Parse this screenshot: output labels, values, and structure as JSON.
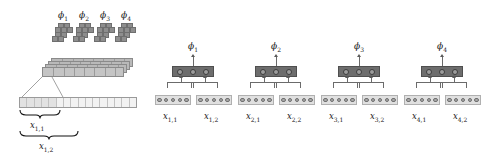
{
  "figure": {
    "title": "",
    "colors": {
      "filter_fill": "#8e8e8e",
      "featuremap_fill": "#b9b9b9",
      "input_tape_fill": "#f2f2f2",
      "input_tape_highlight": "#e2e2e2",
      "dark_unit_fill": "#6d6d6d",
      "dark_unit_node": "#9c9c9c",
      "input_group_fill": "#e0e0e0",
      "input_group_node": "#a8a8a8",
      "line": "#6b6b6b",
      "text": "#1a1a1a"
    }
  },
  "left_panel": {
    "filters": [
      {
        "label": "ϕ1",
        "phi": "ϕ",
        "index": "1"
      },
      {
        "label": "ϕ2",
        "phi": "ϕ",
        "index": "2"
      },
      {
        "label": "ϕ3",
        "phi": "ϕ",
        "index": "3"
      },
      {
        "label": "ϕ4",
        "phi": "ϕ",
        "index": "4"
      }
    ],
    "feature_map_slabs": 4,
    "feature_map_segments": 8,
    "input_tape_cells": 16,
    "input_tape_highlighted_cells": 5,
    "braces": [
      {
        "symbol": "⏟",
        "label_base": "x",
        "label_sub": "1,1"
      },
      {
        "symbol": "⏟",
        "label_base": "x",
        "label_sub": "1,2"
      }
    ]
  },
  "right_panel": {
    "units": [
      {
        "phi_base": "ϕ",
        "phi_sub": "1",
        "nodes": 3,
        "inputs": [
          {
            "base": "x",
            "sub": "1,1",
            "nodes": 5
          },
          {
            "base": "x",
            "sub": "1,2",
            "nodes": 5
          }
        ]
      },
      {
        "phi_base": "ϕ",
        "phi_sub": "2",
        "nodes": 3,
        "inputs": [
          {
            "base": "x",
            "sub": "2,1",
            "nodes": 5
          },
          {
            "base": "x",
            "sub": "2,2",
            "nodes": 5
          }
        ]
      },
      {
        "phi_base": "ϕ",
        "phi_sub": "3",
        "nodes": 3,
        "inputs": [
          {
            "base": "x",
            "sub": "3,1",
            "nodes": 5
          },
          {
            "base": "x",
            "sub": "3,2",
            "nodes": 5
          }
        ]
      },
      {
        "phi_base": "ϕ",
        "phi_sub": "4",
        "nodes": 3,
        "inputs": [
          {
            "base": "x",
            "sub": "4,1",
            "nodes": 5
          },
          {
            "base": "x",
            "sub": "4,2",
            "nodes": 5
          }
        ]
      }
    ]
  }
}
